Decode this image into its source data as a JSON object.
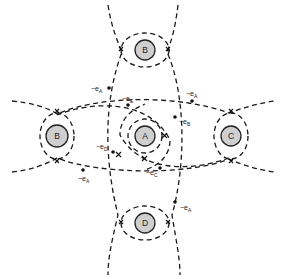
{
  "atoms": [
    {
      "id": "atom-b-top",
      "label": "B",
      "cx": 145,
      "cy": 50
    },
    {
      "id": "atom-b-left",
      "label": "B",
      "cx": 57,
      "cy": 136
    },
    {
      "id": "atom-a",
      "label": "A",
      "cx": 145,
      "cy": 136
    },
    {
      "id": "atom-c",
      "label": "C",
      "cx": 231,
      "cy": 136
    },
    {
      "id": "atom-d",
      "label": "D",
      "cx": 145,
      "cy": 223
    }
  ],
  "electrons": [
    {
      "id": "electron-ea-top-left",
      "prefix": "−e",
      "sub": "A",
      "x": 91,
      "y": 91
    },
    {
      "id": "electron-ee",
      "prefix": "−e",
      "sub": "E",
      "x": 122,
      "y": 101
    },
    {
      "id": "electron-ea-top-right",
      "prefix": "−e",
      "sub": "A",
      "x": 186,
      "y": 96
    },
    {
      "id": "electron-eb",
      "prefix": "−e",
      "sub": "B",
      "x": 179,
      "y": 123
    },
    {
      "id": "electron-ed",
      "prefix": "−e",
      "sub": "D",
      "x": 96,
      "y": 148
    },
    {
      "id": "electron-ec",
      "prefix": "−e",
      "sub": "C",
      "x": 146,
      "y": 174
    },
    {
      "id": "electron-ea-bottom-left",
      "prefix": "−e",
      "sub": "A",
      "x": 78,
      "y": 180
    },
    {
      "id": "electron-ea-bottom-right",
      "prefix": "−e",
      "sub": "A",
      "x": 180,
      "y": 209
    }
  ],
  "colors": {
    "atom_fill": "#cfcfcf",
    "stroke": "#1a1a1a",
    "background": "#ffffff"
  }
}
